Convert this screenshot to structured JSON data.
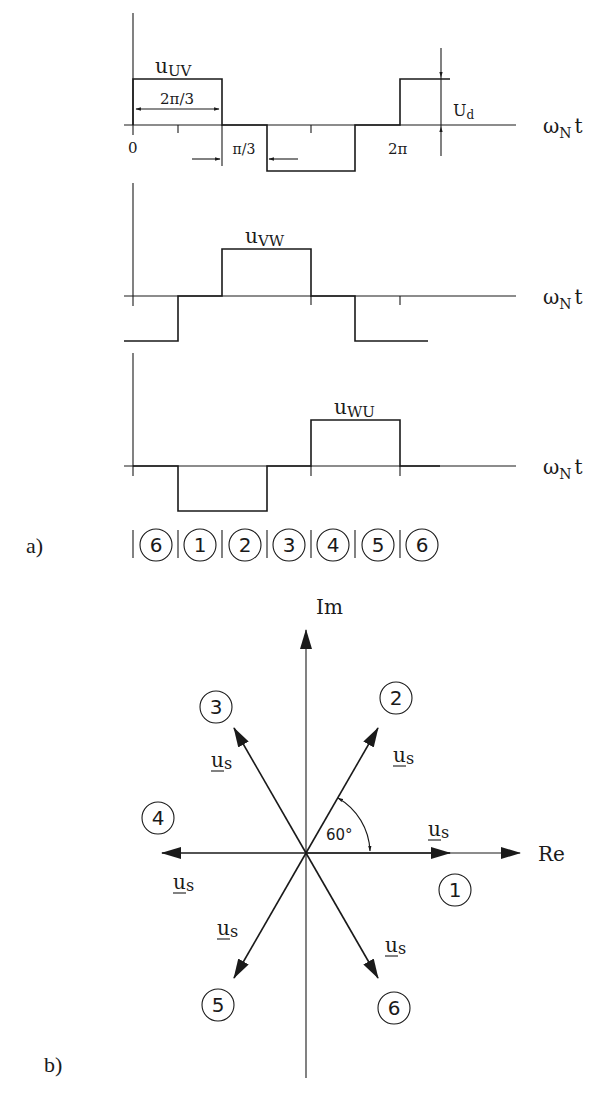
{
  "part_a": {
    "label": "a)",
    "axis_label_main": "ω",
    "axis_label_sub": "N",
    "axis_label_t": "t",
    "origin_tick": "0",
    "period_tick": "2π",
    "width_annotation": "2π/3",
    "gap_annotation": "π/3",
    "amplitude_label_main": "U",
    "amplitude_label_sub": "d",
    "waveforms": [
      {
        "name_main": "u",
        "name_sub": "UV"
      },
      {
        "name_main": "u",
        "name_sub": "VW"
      },
      {
        "name_main": "u",
        "name_sub": "WU"
      }
    ],
    "sectors": [
      "6",
      "1",
      "2",
      "3",
      "4",
      "5",
      "6"
    ]
  },
  "part_b": {
    "label": "b)",
    "re_label": "Re",
    "im_label": "Im",
    "angle_label": "60°",
    "vector_main": "u",
    "vector_sub": "s",
    "vectors": [
      {
        "sector": "1",
        "angle_deg": 0
      },
      {
        "sector": "2",
        "angle_deg": 60
      },
      {
        "sector": "3",
        "angle_deg": 120
      },
      {
        "sector": "4",
        "angle_deg": 180
      },
      {
        "sector": "5",
        "angle_deg": 240
      },
      {
        "sector": "6",
        "angle_deg": 300
      }
    ]
  }
}
